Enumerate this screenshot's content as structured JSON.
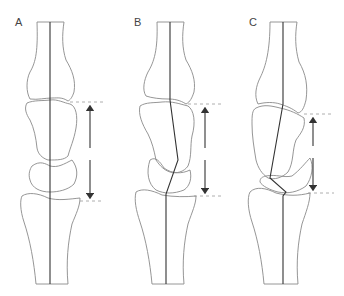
{
  "figure": {
    "panels": [
      {
        "label": "A",
        "state": "neutral alignment",
        "axis": "straight"
      },
      {
        "label": "B",
        "state": "angulated alignment",
        "axis": "zigzag"
      },
      {
        "label": "C",
        "state": "collapsed alignment with reduced carpal height",
        "axis": "zigzag"
      }
    ],
    "arrow_meaning": "carpal height measured between dashed reference lines"
  }
}
